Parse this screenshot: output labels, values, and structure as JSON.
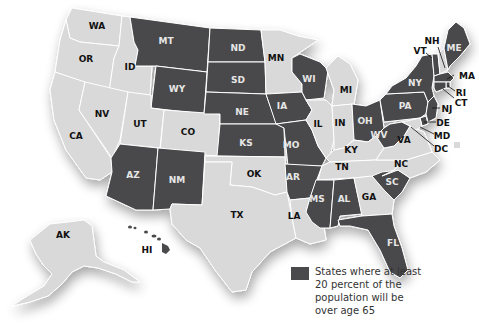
{
  "map": {
    "title": "",
    "colors": {
      "highlight": "#4a4a4c",
      "other": "#d9d9d9",
      "background": "#ffffff"
    },
    "legend": {
      "text": "States where at least 20 percent of the population will be over age 65",
      "color": "#4a4a4c"
    },
    "labels": {
      "WA": "WA",
      "OR": "OR",
      "CA": "CA",
      "ID": "ID",
      "NV": "NV",
      "MT": "MT",
      "WY": "WY",
      "UT": "UT",
      "CO": "CO",
      "AZ": "AZ",
      "NM": "NM",
      "ND": "ND",
      "SD": "SD",
      "NE": "NE",
      "KS": "KS",
      "OK": "OK",
      "TX": "TX",
      "MN": "MN",
      "IA": "IA",
      "MO": "MO",
      "AR": "AR",
      "LA": "LA",
      "WI": "WI",
      "IL": "IL",
      "MI": "MI",
      "IN": "IN",
      "OH": "OH",
      "KY": "KY",
      "TN": "TN",
      "MS": "MS",
      "AL": "AL",
      "GA": "GA",
      "FL": "FL",
      "SC": "SC",
      "NC": "NC",
      "VA": "VA",
      "WV": "WV",
      "PA": "PA",
      "NY": "NY",
      "VT": "VT",
      "NH": "NH",
      "ME": "ME",
      "MA": "MA",
      "RI": "RI",
      "CT": "CT",
      "NJ": "NJ",
      "DE": "DE",
      "MD": "MD",
      "DC": "DC",
      "AK": "AK",
      "HI": "HI"
    },
    "highlighted_states": [
      "MT",
      "WY",
      "ND",
      "SD",
      "NE",
      "KS",
      "IA",
      "MO",
      "AR",
      "WI",
      "AZ",
      "NM",
      "MS",
      "AL",
      "FL",
      "SC",
      "OH",
      "WV",
      "PA",
      "NY",
      "VT",
      "ME",
      "MA",
      "RI",
      "CT",
      "NJ",
      "DE",
      "HI"
    ],
    "other_states": [
      "WA",
      "OR",
      "CA",
      "ID",
      "NV",
      "UT",
      "CO",
      "OK",
      "TX",
      "MN",
      "LA",
      "IL",
      "MI",
      "IN",
      "KY",
      "TN",
      "GA",
      "NC",
      "VA",
      "NH",
      "MD",
      "DC",
      "AK"
    ]
  }
}
